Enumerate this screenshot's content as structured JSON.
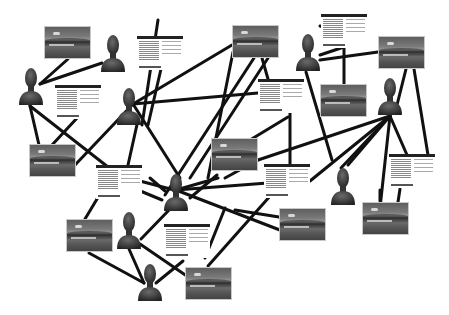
{
  "diagram": {
    "type": "network-graph",
    "edge_color": "#111111",
    "edge_width": 3,
    "node_types": {
      "person": "person-silhouette-icon",
      "photo": "landscape-photo-thumbnail",
      "doc": "document-card"
    },
    "nodes": [
      {
        "id": "p1",
        "type": "person",
        "x": 18,
        "y": 66
      },
      {
        "id": "p2",
        "type": "person",
        "x": 100,
        "y": 33
      },
      {
        "id": "p3",
        "type": "person",
        "x": 116,
        "y": 86
      },
      {
        "id": "p4",
        "type": "person",
        "x": 295,
        "y": 32
      },
      {
        "id": "p5",
        "type": "person",
        "x": 377,
        "y": 76
      },
      {
        "id": "p6",
        "type": "person",
        "x": 163,
        "y": 172
      },
      {
        "id": "p7",
        "type": "person",
        "x": 116,
        "y": 210
      },
      {
        "id": "p8",
        "type": "person",
        "x": 137,
        "y": 262
      },
      {
        "id": "p9",
        "type": "person",
        "x": 330,
        "y": 166
      },
      {
        "id": "i1",
        "type": "photo",
        "x": 44,
        "y": 26,
        "w": 47,
        "h": 33
      },
      {
        "id": "i2",
        "type": "photo",
        "x": 232,
        "y": 25,
        "w": 47,
        "h": 33
      },
      {
        "id": "i3",
        "type": "photo",
        "x": 378,
        "y": 36,
        "w": 47,
        "h": 33
      },
      {
        "id": "i4",
        "type": "photo",
        "x": 320,
        "y": 84,
        "w": 47,
        "h": 33
      },
      {
        "id": "i5",
        "type": "photo",
        "x": 29,
        "y": 144,
        "w": 47,
        "h": 33
      },
      {
        "id": "i6",
        "type": "photo",
        "x": 211,
        "y": 138,
        "w": 47,
        "h": 33
      },
      {
        "id": "i7",
        "type": "photo",
        "x": 66,
        "y": 219,
        "w": 47,
        "h": 33
      },
      {
        "id": "i8",
        "type": "photo",
        "x": 279,
        "y": 208,
        "w": 47,
        "h": 33
      },
      {
        "id": "i9",
        "type": "photo",
        "x": 362,
        "y": 202,
        "w": 47,
        "h": 33
      },
      {
        "id": "i10",
        "type": "photo",
        "x": 185,
        "y": 267,
        "w": 47,
        "h": 33
      },
      {
        "id": "d1",
        "type": "doc",
        "x": 137,
        "y": 36
      },
      {
        "id": "d2",
        "type": "doc",
        "x": 55,
        "y": 85
      },
      {
        "id": "d3",
        "type": "doc",
        "x": 321,
        "y": 14
      },
      {
        "id": "d4",
        "type": "doc",
        "x": 258,
        "y": 79
      },
      {
        "id": "d5",
        "type": "doc",
        "x": 96,
        "y": 165
      },
      {
        "id": "d6",
        "type": "doc",
        "x": 264,
        "y": 164
      },
      {
        "id": "d7",
        "type": "doc",
        "x": 389,
        "y": 154
      },
      {
        "id": "d8",
        "type": "doc",
        "x": 164,
        "y": 224
      }
    ],
    "edges": [
      [
        68,
        59,
        40,
        84
      ],
      [
        102,
        63,
        40,
        84
      ],
      [
        30,
        106,
        39,
        145
      ],
      [
        30,
        106,
        108,
        167
      ],
      [
        78,
        117,
        52,
        145
      ],
      [
        161,
        69,
        148,
        125
      ],
      [
        133,
        104,
        232,
        45
      ],
      [
        133,
        104,
        258,
        93
      ],
      [
        133,
        104,
        180,
        178
      ],
      [
        133,
        104,
        75,
        165
      ],
      [
        142,
        125,
        158,
        20
      ],
      [
        268,
        58,
        190,
        178
      ],
      [
        254,
        58,
        165,
        195
      ],
      [
        262,
        58,
        268,
        79
      ],
      [
        233,
        52,
        208,
        178
      ],
      [
        288,
        117,
        250,
        140
      ],
      [
        290,
        102,
        290,
        165
      ],
      [
        320,
        26,
        352,
        36
      ],
      [
        320,
        60,
        378,
        52
      ],
      [
        320,
        55,
        344,
        47
      ],
      [
        344,
        47,
        344,
        84
      ],
      [
        306,
        72,
        332,
        160
      ],
      [
        406,
        69,
        397,
        105
      ],
      [
        414,
        69,
        428,
        155
      ],
      [
        390,
        116,
        258,
        160
      ],
      [
        390,
        116,
        341,
        168
      ],
      [
        390,
        116,
        380,
        208
      ],
      [
        390,
        116,
        407,
        155
      ],
      [
        390,
        116,
        310,
        181
      ],
      [
        390,
        116,
        348,
        165
      ],
      [
        258,
        160,
        225,
        178
      ],
      [
        136,
        180,
        178,
        191
      ],
      [
        138,
        190,
        162,
        200
      ],
      [
        176,
        190,
        218,
        178
      ],
      [
        176,
        190,
        298,
        237
      ],
      [
        176,
        190,
        294,
        181
      ],
      [
        141,
        239,
        170,
        209
      ],
      [
        89,
        253,
        144,
        283
      ],
      [
        129,
        249,
        144,
        283
      ],
      [
        140,
        244,
        197,
        283
      ],
      [
        183,
        261,
        156,
        283
      ],
      [
        208,
        266,
        271,
        195
      ],
      [
        205,
        258,
        225,
        208
      ],
      [
        380,
        201,
        380,
        190
      ],
      [
        400,
        189,
        398,
        202
      ],
      [
        85,
        219,
        100,
        194
      ],
      [
        128,
        165,
        138,
        120
      ],
      [
        120,
        170,
        100,
        190
      ],
      [
        150,
        178,
        165,
        191
      ],
      [
        217,
        175,
        190,
        198
      ],
      [
        235,
        210,
        279,
        217
      ]
    ]
  }
}
